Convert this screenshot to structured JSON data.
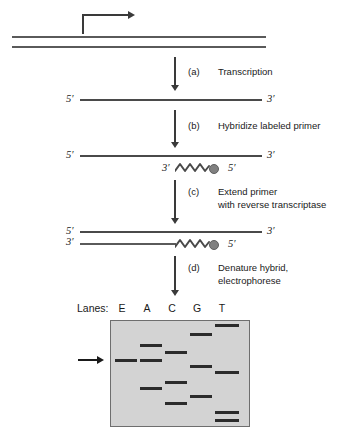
{
  "figure": {
    "colors": {
      "strand": "#4a4a4a",
      "arrow": "#3a3a3a",
      "gel_background": "#d3d3d3",
      "gel_border": "#6e6e6e",
      "band": "#2b2b2b",
      "primer_tag": "#808080"
    }
  },
  "duplex": {
    "promoter_arrow_name": "transcription-start-arrow",
    "top_strand_name": "dna-top-strand",
    "bottom_strand_name": "dna-bottom-strand"
  },
  "steps": [
    {
      "letter": "(a)",
      "text": "Transcription"
    },
    {
      "letter": "(b)",
      "text": "Hybridize labeled primer"
    },
    {
      "letter": "(c)",
      "text": "Extend primer\nwith reverse transcriptase"
    },
    {
      "letter": "(d)",
      "text": "Denature hybrid,\nelectrophorese"
    }
  ],
  "molecules": {
    "transcript": {
      "five_prime": "5′",
      "three_prime": "3′"
    },
    "hybridized": {
      "rna_five_prime": "5′",
      "rna_three_prime": "3′",
      "primer_three_prime": "3′",
      "primer_five_prime": "5′"
    },
    "extended": {
      "rna_five_prime": "5′",
      "rna_three_prime": "3′",
      "cdna_three_prime": "3′",
      "cdna_five_prime": "5′"
    }
  },
  "gel": {
    "caption": "Lanes:",
    "lane_labels": [
      "E",
      "A",
      "C",
      "G",
      "T"
    ],
    "marker_arrow_name": "extension-product-pointer",
    "bands": [
      {
        "lane": "E",
        "positions": [
          360
        ]
      },
      {
        "lane": "A",
        "positions": [
          345,
          360,
          388
        ]
      },
      {
        "lane": "C",
        "positions": [
          352,
          382,
          403
        ]
      },
      {
        "lane": "G",
        "positions": [
          334,
          366,
          396
        ]
      },
      {
        "lane": "T",
        "positions": [
          325,
          372,
          412,
          420
        ]
      }
    ]
  }
}
